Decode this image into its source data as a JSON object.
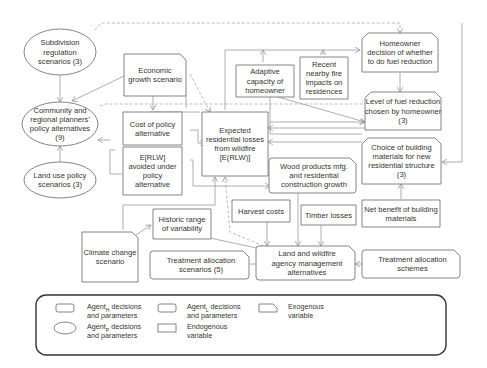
{
  "nodes": {
    "subdivision": {
      "lines": [
        "Subdivision",
        "regulation",
        "scenarios (3)"
      ],
      "agent": "planner"
    },
    "community": {
      "lines": [
        "Community and",
        "regional planners'",
        "policy alternatives",
        "(9)"
      ],
      "agent": "planner"
    },
    "land_use": {
      "lines": [
        "Land use policy",
        "scenarios (3)"
      ],
      "agent": "planner"
    },
    "economic": {
      "lines": [
        "Economic",
        "growth scenario"
      ],
      "agent": "exogenous"
    },
    "cost_policy": {
      "lines": [
        "Cost of policy",
        "alternative"
      ],
      "agent": "endogenous"
    },
    "erlw_avoided": {
      "lines": [
        "E[RLW]",
        "avoided under",
        "policy",
        "alternative"
      ],
      "agent": "endogenous"
    },
    "expected_losses": {
      "lines": [
        "Expected",
        "residential losses",
        "from wildfire",
        "[E(RLW)]"
      ],
      "agent": "endogenous"
    },
    "adaptive": {
      "lines": [
        "Adaptive",
        "capacity of",
        "homeowner"
      ],
      "agent": "endogenous"
    },
    "recent_fire": {
      "lines": [
        "Recent",
        "nearby fire",
        "impacts on",
        "residences"
      ],
      "agent": "endogenous"
    },
    "homeowner_decision": {
      "lines": [
        "Homeowner",
        "decision of whether",
        "to do fuel reduction"
      ],
      "agent": "homeowner"
    },
    "fuel_level": {
      "lines": [
        "Level of fuel reduction",
        "chosen by homeowner",
        "(3)"
      ],
      "agent": "homeowner"
    },
    "building_choice": {
      "lines": [
        "Choice of building",
        "materials for new",
        "residential structure",
        "(3)"
      ],
      "agent": "homeowner"
    },
    "wood_products": {
      "lines": [
        "Wood products mfg.",
        "and residential",
        "construction growth"
      ],
      "agent": "endogenous"
    },
    "net_benefit": {
      "lines": [
        "Net benefit of building",
        "materials"
      ],
      "agent": "endogenous"
    },
    "harvest": {
      "lines": [
        "Harvest costs"
      ],
      "agent": "endogenous"
    },
    "timber": {
      "lines": [
        "Timber losses"
      ],
      "agent": "endogenous"
    },
    "historic": {
      "lines": [
        "Historic range",
        "of variability"
      ],
      "agent": "endogenous"
    },
    "climate": {
      "lines": [
        "Climate change",
        "scenario"
      ],
      "agent": "exogenous"
    },
    "treatment_scen": {
      "lines": [
        "Treatment allocation",
        "scenarios (5)"
      ],
      "agent": "land"
    },
    "land_agency": {
      "lines": [
        "Land and wildfire",
        "agency management",
        "alternatives"
      ],
      "agent": "land"
    },
    "treatment_schemes": {
      "lines": [
        "Treatment allocation",
        "schemes"
      ],
      "agent": "land"
    }
  },
  "legend": {
    "items": [
      {
        "agent": "Agent",
        "sub": "H",
        "rest": " decisions",
        "line2": "and parameters",
        "shape": "rect-clipped-top"
      },
      {
        "agent": "Agent",
        "sub": "P",
        "rest": " decisions",
        "line2": "and parameters",
        "shape": "ellipse"
      },
      {
        "agent": "Agent",
        "sub": "L",
        "rest": " decisions",
        "line2": "and parameters",
        "shape": "rect-clipped-right"
      },
      {
        "agent": "Endogenous",
        "sub": "",
        "rest": "",
        "line2": "variable",
        "shape": "rect"
      },
      {
        "agent": "Exogenous",
        "sub": "",
        "rest": "",
        "line2": "variable",
        "shape": "rect-clipped-one"
      }
    ]
  }
}
